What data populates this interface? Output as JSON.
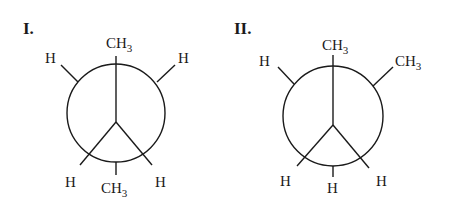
{
  "figure": {
    "type": "Newman projections",
    "projections": [
      {
        "label": "I.",
        "front_carbon": {
          "top": "CH",
          "top_sub": "3",
          "lower_left": "H",
          "lower_right": "H"
        },
        "back_carbon": {
          "upper_left": "H",
          "upper_right": "H",
          "bottom": "CH",
          "bottom_sub": "3"
        }
      },
      {
        "label": "II.",
        "front_carbon": {
          "top": "CH",
          "top_sub": "3",
          "lower_left": "H",
          "lower_right": "H"
        },
        "back_carbon": {
          "upper_left": "H",
          "upper_right": "CH",
          "upper_right_sub": "3",
          "bottom": "H"
        }
      }
    ]
  }
}
